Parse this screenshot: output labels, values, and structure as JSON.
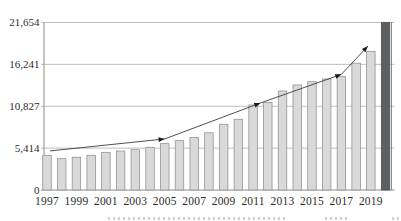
{
  "chart_data": {
    "type": "bar",
    "title": "",
    "categories": [
      "1997",
      "1998",
      "1999",
      "2000",
      "2001",
      "2002",
      "2003",
      "2004",
      "2005",
      "2006",
      "2007",
      "2008",
      "2009",
      "2010",
      "2011",
      "2012",
      "2013",
      "2014",
      "2015",
      "2016",
      "2017",
      "2018",
      "2019",
      "2020"
    ],
    "values": [
      4480,
      4050,
      4230,
      4490,
      4870,
      5040,
      5210,
      5520,
      5990,
      6380,
      6780,
      7400,
      8500,
      9140,
      10990,
      11290,
      12800,
      13580,
      14000,
      14350,
      14650,
      16400,
      17900,
      21654
    ],
    "highlight_category": "2020",
    "x_tick_labels": [
      "1997",
      "1999",
      "2001",
      "2003",
      "2005",
      "2007",
      "2009",
      "2011",
      "2013",
      "2015",
      "2017",
      "2019"
    ],
    "y_tick_labels": [
      "0",
      "5,414",
      "10,827",
      "16,241",
      "21,654"
    ],
    "y_tick_values": [
      0,
      5414,
      10827,
      16241,
      21654
    ],
    "ylim": [
      0,
      21654
    ],
    "grid": true,
    "legend": "none",
    "trend_line": {
      "points": [
        {
          "year": 1997.2,
          "value": 5050
        },
        {
          "year": 2005.0,
          "value": 6600
        },
        {
          "year": 2011.5,
          "value": 11250
        },
        {
          "year": 2017.0,
          "value": 14950
        },
        {
          "year": 2018.8,
          "value": 18600
        }
      ],
      "arrow_at": [
        1,
        2,
        3,
        4
      ]
    },
    "colors": {
      "bar_fill": "#d9d9d9",
      "bar_border": "#8f8f8f",
      "highlight_fill": "#5c6063",
      "highlight_border": "#4b4f52",
      "grid": "#a9a9a9",
      "axis": "#8a8a8a",
      "tick_label": "#2b2b2b",
      "trend": "#3c3c3c",
      "arrow": "#1a1a1a"
    }
  }
}
